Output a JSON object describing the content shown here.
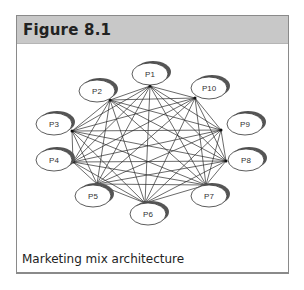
{
  "figure": {
    "title": "Figure 8.1",
    "caption": "Marketing mix architecture"
  },
  "diagram": {
    "type": "fully-connected network",
    "nodes": [
      {
        "id": "P1",
        "label": "P1",
        "cx": 150,
        "cy": 74,
        "ax": 150,
        "ay": 86
      },
      {
        "id": "P2",
        "label": "P2",
        "cx": 97,
        "cy": 91,
        "ax": 110,
        "ay": 100
      },
      {
        "id": "P3",
        "label": "P3",
        "cx": 54,
        "cy": 124,
        "ax": 72,
        "ay": 131
      },
      {
        "id": "P4",
        "label": "P4",
        "cx": 54,
        "cy": 160,
        "ax": 73,
        "ay": 162
      },
      {
        "id": "P5",
        "label": "P5",
        "cx": 93,
        "cy": 196,
        "ax": 97,
        "ay": 184
      },
      {
        "id": "P6",
        "label": "P6",
        "cx": 148,
        "cy": 214,
        "ax": 145,
        "ay": 203
      },
      {
        "id": "P7",
        "label": "P7",
        "cx": 209,
        "cy": 196,
        "ax": 206,
        "ay": 185
      },
      {
        "id": "P8",
        "label": "P8",
        "cx": 246,
        "cy": 160,
        "ax": 226,
        "ay": 161
      },
      {
        "id": "P9",
        "label": "P9",
        "cx": 245,
        "cy": 124,
        "ax": 221,
        "ay": 130
      },
      {
        "id": "P10",
        "label": "P10",
        "cx": 209,
        "cy": 88,
        "ax": 195,
        "ay": 98
      }
    ],
    "colors": {
      "line": "#2a2a2a",
      "node_fill": "#ffffff",
      "node_stroke": "#333333",
      "shadow": "#555555"
    }
  }
}
